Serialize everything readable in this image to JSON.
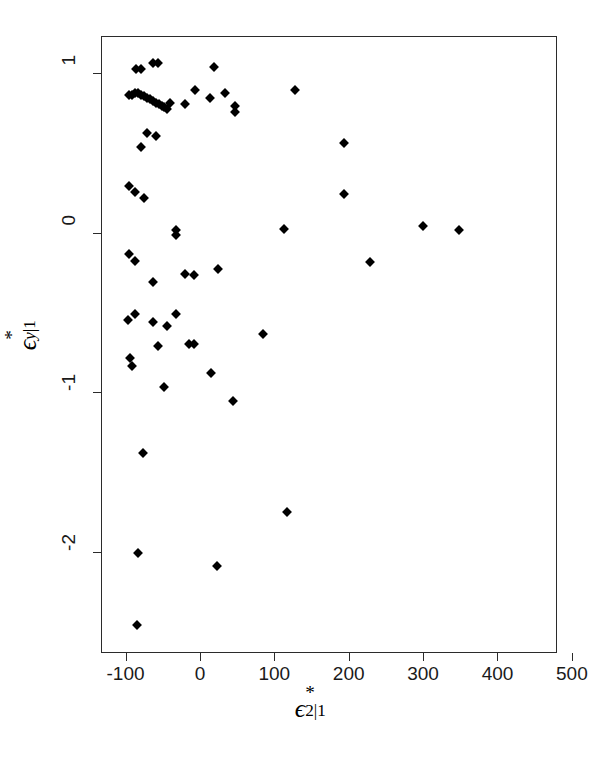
{
  "figure": {
    "background_color": "#ffffff",
    "marker_color": "#000000",
    "axis_color": "#2b2b2b",
    "marker_shape": "diamond"
  },
  "axes": {
    "x": {
      "label_parts": {
        "base": "ϵ",
        "superscript": "*",
        "subscript": "2|1"
      },
      "ticks": [
        -100,
        0,
        100,
        200,
        300,
        400,
        500
      ],
      "tick_labels": [
        "-100",
        "0",
        "100",
        "200",
        "300",
        "400",
        "500"
      ],
      "range": [
        -133,
        480
      ]
    },
    "y": {
      "label_parts": {
        "base": "ϵ",
        "superscript": "*",
        "subscript": "y|1"
      },
      "ticks": [
        1,
        0,
        -1,
        -2
      ],
      "tick_labels": [
        "1",
        "0",
        "-1",
        "-2"
      ],
      "range": [
        -2.63,
        1.23
      ]
    }
  },
  "chart_data": {
    "type": "scatter",
    "title": "",
    "xlabel": "ϵ*_2|1",
    "ylabel": "ϵ*_y|1",
    "xlim": [
      -133,
      480
    ],
    "ylim": [
      -2.63,
      1.23
    ],
    "xticks": [
      -100,
      0,
      100,
      200,
      300,
      400,
      500
    ],
    "yticks": [
      1,
      0,
      -1,
      -2
    ],
    "grid": false,
    "legend": "none",
    "series": [
      {
        "name": "residuals",
        "marker": "diamond",
        "color": "#000000",
        "points": [
          [
            -87,
            1.03
          ],
          [
            -81,
            1.03
          ],
          [
            -65,
            1.07
          ],
          [
            -58,
            1.07
          ],
          [
            17,
            1.04
          ],
          [
            -97,
            0.87
          ],
          [
            -93,
            0.87
          ],
          [
            -89,
            0.88
          ],
          [
            -85,
            0.88
          ],
          [
            -81,
            0.87
          ],
          [
            -77,
            0.86
          ],
          [
            -73,
            0.85
          ],
          [
            -69,
            0.84
          ],
          [
            -65,
            0.83
          ],
          [
            -61,
            0.82
          ],
          [
            -57,
            0.81
          ],
          [
            -53,
            0.8
          ],
          [
            -49,
            0.79
          ],
          [
            -45,
            0.78
          ],
          [
            -41,
            0.82
          ],
          [
            -22,
            0.81
          ],
          [
            -8,
            0.9
          ],
          [
            12,
            0.85
          ],
          [
            33,
            0.88
          ],
          [
            46,
            0.8
          ],
          [
            46,
            0.76
          ],
          [
            126,
            0.9
          ],
          [
            -73,
            0.63
          ],
          [
            -61,
            0.61
          ],
          [
            -80,
            0.54
          ],
          [
            192,
            0.57
          ],
          [
            -97,
            0.3
          ],
          [
            -89,
            0.26
          ],
          [
            -76,
            0.22
          ],
          [
            -34,
            0.02
          ],
          [
            -34,
            -0.01
          ],
          [
            192,
            0.25
          ],
          [
            111,
            0.03
          ],
          [
            299,
            0.05
          ],
          [
            347,
            0.02
          ],
          [
            -97,
            -0.13
          ],
          [
            -88,
            -0.17
          ],
          [
            -64,
            -0.3
          ],
          [
            227,
            -0.18
          ],
          [
            -22,
            -0.25
          ],
          [
            -9,
            -0.26
          ],
          [
            23,
            -0.22
          ],
          [
            -98,
            -0.54
          ],
          [
            -88,
            -0.5
          ],
          [
            -65,
            -0.55
          ],
          [
            -46,
            -0.58
          ],
          [
            -58,
            -0.7
          ],
          [
            -33,
            -0.5
          ],
          [
            -96,
            -0.78
          ],
          [
            -93,
            -0.83
          ],
          [
            -16,
            -0.69
          ],
          [
            -10,
            -0.69
          ],
          [
            83,
            -0.63
          ],
          [
            -50,
            -0.96
          ],
          [
            13,
            -0.87
          ],
          [
            43,
            -1.05
          ],
          [
            -78,
            -1.37
          ],
          [
            -85,
            -2.0
          ],
          [
            22,
            -2.08
          ],
          [
            116,
            -1.74
          ],
          [
            -86,
            -2.45
          ]
        ]
      }
    ]
  }
}
